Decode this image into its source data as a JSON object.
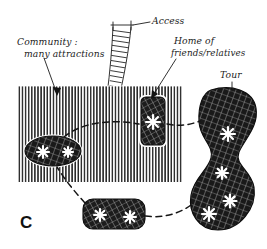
{
  "figure": {
    "letter": "C",
    "caption_style": "hand-drawn ink diagram",
    "background_color": "#ffffff",
    "ink_color": "#141414"
  },
  "labels": [
    {
      "id": "access",
      "text": "Access",
      "x": 152,
      "y": 23
    },
    {
      "id": "community",
      "text_line1": "Community :",
      "text_line2": "many attractions",
      "x": 18,
      "y": 47
    },
    {
      "id": "home",
      "text_line1": "Home of",
      "text_line2": "friends/relatives",
      "x": 171,
      "y": 49
    },
    {
      "id": "tour",
      "text": "Tour",
      "x": 223,
      "y": 78
    }
  ],
  "shapes": {
    "community_rect": {
      "name": "community",
      "fill_pattern": "vertical-hatch",
      "x": 18,
      "y": 86,
      "width": 165,
      "height": 96,
      "attractions_count": 0
    },
    "access_road": {
      "name": "access",
      "fill_pattern": "ladder-rungs",
      "description": "curved banded road entering community from top, ending in arrowhead"
    },
    "attraction_ellipse": {
      "name": "attraction-cluster-ellipse",
      "fill_pattern": "cross-hatch",
      "cx": 53,
      "cy": 151,
      "rx": 28,
      "ry": 15,
      "asterisks": 2
    },
    "home_rect": {
      "name": "home-of-friends-relatives",
      "fill_pattern": "cross-hatch",
      "x": 141,
      "y": 97,
      "width": 24,
      "height": 48,
      "asterisks": 1
    },
    "tour_blob": {
      "name": "tour-destination-blob",
      "fill_pattern": "cross-hatch",
      "asterisks": 4
    },
    "small_blob": {
      "name": "secondary-attraction-blob",
      "fill_pattern": "cross-hatch",
      "x": 83,
      "y": 199,
      "width": 62,
      "height": 30,
      "asterisks": 2
    }
  },
  "tour_route": {
    "style": "dashed-loop",
    "stops": [
      "attraction-cluster-ellipse",
      "home-of-friends-relatives",
      "tour-destination-blob",
      "secondary-attraction-blob"
    ]
  },
  "legend_note": {
    "asterisk_meaning": "attraction"
  }
}
